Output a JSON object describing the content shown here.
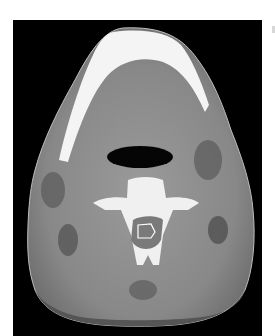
{
  "image": {
    "description": "Axial CT scan of the neck at the level of the mandible and cervical vertebra, soft tissue window",
    "modality": "CT",
    "plane": "axial",
    "annotation": "Outlined region within the spinal canal",
    "colors": {
      "background": "#000000",
      "soft_tissue": "#8a8a8a",
      "bone": "#f2f2f2",
      "air": "#050505",
      "fat": "#4a4a4a",
      "margin": "#ffffff"
    }
  }
}
